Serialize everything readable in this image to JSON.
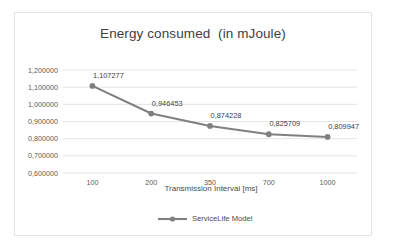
{
  "chart_data": {
    "type": "line",
    "title": "Energy consumed  (in mJoule)",
    "xlabel": "Transmission Interval [ms]",
    "ylabel": "",
    "categories": [
      "100",
      "200",
      "350",
      "700",
      "1000"
    ],
    "x": [
      100,
      200,
      350,
      700,
      1000
    ],
    "series": [
      {
        "name": "ServiceLife Model",
        "values": [
          1.107277,
          0.946453,
          0.874228,
          0.825709,
          0.809947
        ],
        "value_labels": [
          "1,107277",
          "0,946453",
          "0,874228",
          "0,825709",
          "0,809947"
        ],
        "color": "#808080"
      }
    ],
    "ylim": [
      0.6,
      1.2
    ],
    "ytick_values": [
      1.2,
      1.1,
      1.0,
      0.9,
      0.8,
      0.7,
      0.6
    ],
    "ytick_labels": [
      "1,200000",
      "1,100000",
      "1,000000",
      "0,900000",
      "0,800000",
      "0,700000",
      "0,600000"
    ],
    "grid": true,
    "legend_position": "bottom",
    "decimal_separator": ","
  },
  "colors": {
    "series_line": "#808080",
    "gridline": "#d9d9d9",
    "text": "#404040",
    "tick_text": "#5a5a5a",
    "frame_border": "#e2e2e2",
    "background": "#ffffff"
  }
}
